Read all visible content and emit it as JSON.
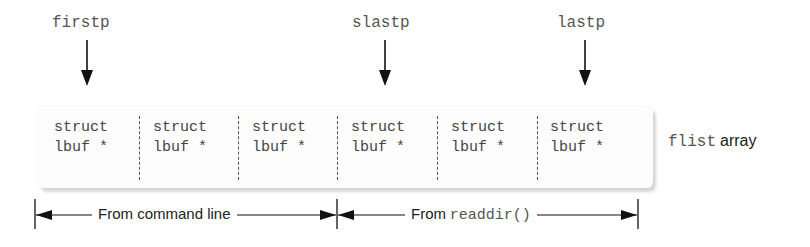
{
  "pointers": [
    {
      "label": "firstp",
      "x": 52,
      "arrow_x": 87
    },
    {
      "label": "slastp",
      "x": 352,
      "arrow_x": 385
    },
    {
      "label": "lastp",
      "x": 557,
      "arrow_x": 585
    }
  ],
  "array": {
    "cells": [
      {
        "line1": "struct",
        "line2": "lbuf *"
      },
      {
        "line1": "struct",
        "line2": "lbuf *"
      },
      {
        "line1": "struct",
        "line2": "lbuf *"
      },
      {
        "line1": "struct",
        "line2": "lbuf *"
      },
      {
        "line1": "struct",
        "line2": "lbuf *"
      },
      {
        "line1": "struct",
        "line2": "lbuf *"
      }
    ],
    "name_code": "flist",
    "name_text": "array"
  },
  "ranges": [
    {
      "prefix": "From command line",
      "code": ""
    },
    {
      "prefix": "From",
      "code": "readdir()"
    }
  ]
}
